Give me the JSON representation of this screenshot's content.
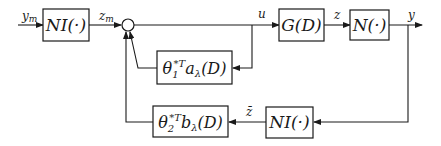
{
  "diagram": {
    "blocks": {
      "ni_input": {
        "label_main": "NI(·)"
      },
      "g": {
        "label_main": "G(D)"
      },
      "n": {
        "label_main": "N(·)"
      },
      "theta1": {
        "label_base": "θ",
        "label_sub": "1",
        "label_sup": "*T",
        "label_rest": "a",
        "label_rest_sub": "λ",
        "label_tail": "(D)"
      },
      "theta2": {
        "label_base": "θ",
        "label_sub": "2",
        "label_sup": "*T",
        "label_rest": "b",
        "label_rest_sub": "λ",
        "label_tail": "(D)"
      },
      "ni_feedback": {
        "label_main": "NI(·)"
      }
    },
    "signals": {
      "ym": {
        "base": "y",
        "sub": "m"
      },
      "zm": {
        "base": "z",
        "sub": "m"
      },
      "u": {
        "base": "u"
      },
      "z": {
        "base": "z"
      },
      "y": {
        "base": "y"
      },
      "zbar": {
        "base": "z̄"
      }
    },
    "summing_junction": {
      "symbol": ""
    }
  }
}
